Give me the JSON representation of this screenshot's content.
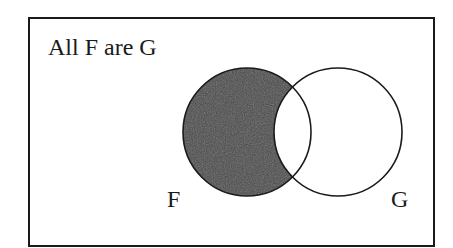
{
  "diagram": {
    "title": "All F are G",
    "type": "venn",
    "sets": [
      {
        "id": "F",
        "label": "F",
        "cx": 247,
        "cy": 132,
        "r": 64
      },
      {
        "id": "G",
        "label": "G",
        "cx": 338,
        "cy": 132,
        "r": 64
      }
    ],
    "shaded_region": "F minus G",
    "colors": {
      "background": "#ffffff",
      "border": "#1a1a1a",
      "stroke": "#1a1a1a",
      "shade": "#4a4a4a",
      "text": "#1a1a1a"
    }
  }
}
